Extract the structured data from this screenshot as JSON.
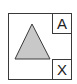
{
  "diagram": {
    "shape": "triangle",
    "shape_fill": "#c8c8c8",
    "stroke_color": "#3a3a3a",
    "labels": {
      "top_right": "A",
      "bottom_right": "X"
    }
  }
}
